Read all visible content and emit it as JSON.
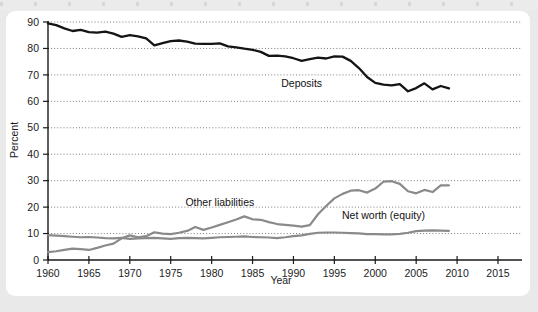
{
  "figure": {
    "panel_background": "#ffffff",
    "page_background": "#e9e9e9"
  },
  "chart_data": {
    "type": "line",
    "title": "",
    "xlabel": "Year",
    "ylabel": "Percent",
    "xlim": [
      1960,
      2016
    ],
    "ylim": [
      0,
      92
    ],
    "xticks": [
      1960,
      1965,
      1970,
      1975,
      1980,
      1985,
      1990,
      1995,
      2000,
      2005,
      2010,
      2015
    ],
    "yticks": [
      0,
      10,
      20,
      30,
      40,
      50,
      60,
      70,
      80,
      90
    ],
    "grid": "horizontal-dotted",
    "legend": "inline-annotations",
    "x": [
      1960,
      1961,
      1962,
      1963,
      1964,
      1965,
      1966,
      1967,
      1968,
      1969,
      1970,
      1971,
      1972,
      1973,
      1974,
      1975,
      1976,
      1977,
      1978,
      1979,
      1980,
      1981,
      1982,
      1983,
      1984,
      1985,
      1986,
      1987,
      1988,
      1989,
      1990,
      1991,
      1992,
      1993,
      1994,
      1995,
      1996,
      1997,
      1998,
      1999,
      2000,
      2001,
      2002,
      2003,
      2004,
      2005,
      2006,
      2007,
      2008,
      2009
    ],
    "series": [
      {
        "name": "Deposits",
        "color": "#141414",
        "label_x": 1991,
        "label_y": 65.5,
        "values": [
          89.5,
          88.8,
          87.6,
          86.6,
          87.0,
          86.2,
          86.0,
          86.4,
          85.6,
          84.4,
          85.0,
          84.6,
          83.8,
          81.2,
          82.0,
          82.8,
          83.0,
          82.6,
          81.8,
          81.7,
          81.7,
          81.9,
          80.8,
          80.4,
          79.9,
          79.5,
          78.7,
          77.2,
          77.3,
          77.0,
          76.3,
          75.3,
          76.0,
          76.5,
          76.2,
          77.0,
          76.9,
          75.3,
          72.6,
          69.2,
          67.0,
          66.3,
          66.0,
          66.5,
          63.8,
          65.0,
          66.8,
          64.5,
          65.8,
          64.9
        ]
      },
      {
        "name": "Other liabilities",
        "color": "#8a8a8a",
        "label_x": 1981,
        "label_y": 20.5,
        "values": [
          3.0,
          3.3,
          3.8,
          4.3,
          4.1,
          3.8,
          4.6,
          5.5,
          6.2,
          8.2,
          9.3,
          8.6,
          9.0,
          10.5,
          10.0,
          9.8,
          10.3,
          11.0,
          12.5,
          11.4,
          12.3,
          13.3,
          14.3,
          15.3,
          16.5,
          15.4,
          15.2,
          14.3,
          13.6,
          13.3,
          13.0,
          12.6,
          13.2,
          17.3,
          20.4,
          23.3,
          25.0,
          26.2,
          26.4,
          25.5,
          27.0,
          29.6,
          29.8,
          28.8,
          26.0,
          25.2,
          26.5,
          25.7,
          28.2,
          28.2
        ]
      },
      {
        "name": "Net worth (equity)",
        "color": "#8a8a8a",
        "label_x": 2001,
        "label_y": 15.5,
        "values": [
          9.4,
          9.2,
          9.0,
          8.8,
          8.6,
          8.7,
          8.5,
          8.3,
          8.2,
          8.4,
          8.0,
          8.2,
          8.3,
          8.4,
          8.2,
          8.0,
          8.3,
          8.4,
          8.3,
          8.2,
          8.4,
          8.6,
          8.7,
          8.8,
          8.9,
          8.7,
          8.6,
          8.5,
          8.3,
          8.6,
          9.0,
          9.3,
          9.9,
          10.3,
          10.4,
          10.4,
          10.3,
          10.2,
          10.1,
          9.8,
          9.8,
          9.7,
          9.7,
          9.9,
          10.3,
          10.9,
          11.1,
          11.2,
          11.1,
          11.0
        ]
      }
    ]
  },
  "axes": {
    "y_tick_labels": [
      "0",
      "10",
      "20",
      "30",
      "40",
      "50",
      "60",
      "70",
      "80",
      "90"
    ],
    "x_tick_labels": [
      "1960",
      "1965",
      "1970",
      "1975",
      "1980",
      "1985",
      "1990",
      "1995",
      "2000",
      "2005",
      "2010",
      "2015"
    ],
    "y_axis_title": "Percent",
    "x_axis_title": "Year"
  }
}
